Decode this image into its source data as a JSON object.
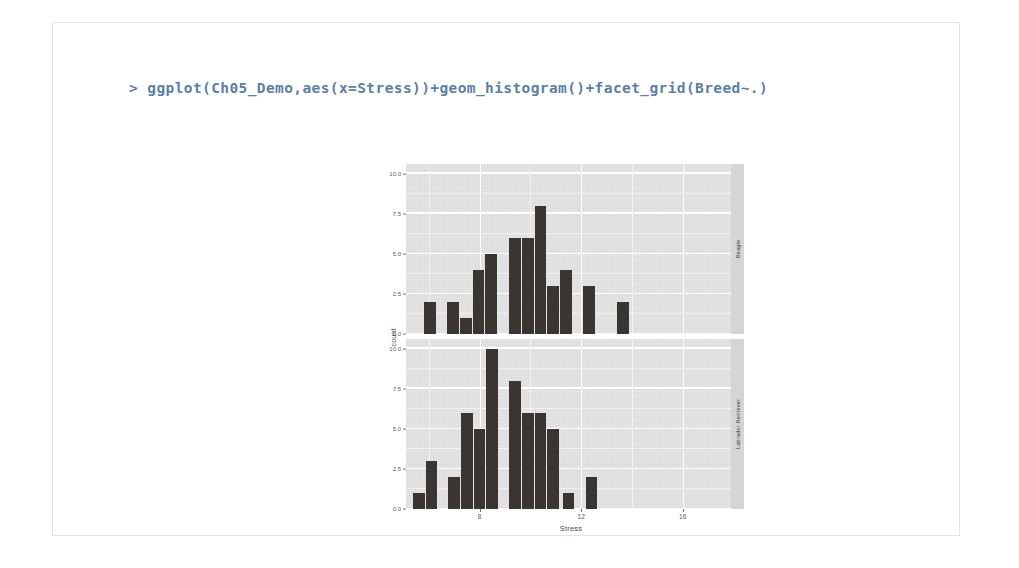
{
  "console": {
    "prompt": ">",
    "command": "> ggplot(Ch05_Demo,aes(x=Stress))+geom_histogram()+facet_grid(Breed~.)",
    "text_color": "#5b7fa6"
  },
  "chart_data": {
    "type": "bar",
    "subtype": "faceted-histogram",
    "title": "",
    "xlabel": "Stress",
    "ylabel": "count",
    "xlim": [
      5.1,
      17.9
    ],
    "ylim": [
      0,
      10.6
    ],
    "x_ticks": [
      8,
      12,
      16
    ],
    "x_tick_labels": [
      "8",
      "12",
      "16"
    ],
    "y_ticks": [
      0.0,
      2.5,
      5.0,
      7.5,
      10.0
    ],
    "y_tick_labels": [
      "0.0",
      "2.5",
      "5.0",
      "7.5",
      "10.0"
    ],
    "grid": true,
    "legend": "none",
    "facet_variable": "Breed",
    "facet_direction": "rows",
    "panel_fill": "#e2e2e2",
    "strip_fill": "#d5d5d5",
    "bar_color": "#3a3531",
    "bin_width": 0.46,
    "panels": [
      {
        "strip_label": "Beagle",
        "x": [
          6.05,
          6.95,
          7.45,
          7.95,
          8.45,
          9.4,
          9.9,
          10.4,
          10.9,
          11.4,
          12.3,
          13.65
        ],
        "values": [
          2,
          2,
          1,
          4,
          5,
          6,
          6,
          8,
          3,
          4,
          3,
          2
        ]
      },
      {
        "strip_label": "Labrador Retriever",
        "x": [
          5.6,
          6.1,
          7.0,
          7.5,
          8.0,
          8.5,
          9.4,
          9.9,
          10.4,
          10.9,
          11.5,
          12.4
        ],
        "values": [
          1,
          3,
          2,
          6,
          5,
          10,
          8,
          6,
          6,
          5,
          1,
          2
        ]
      }
    ]
  }
}
